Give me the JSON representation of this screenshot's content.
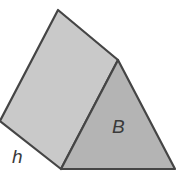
{
  "diagram": {
    "labels": {
      "base": "B",
      "height": "h"
    },
    "colors": {
      "side_face": "#c9c9c9",
      "base_face": "#b4b4b4",
      "edge": "#454545",
      "label": "#3a3a3a"
    }
  }
}
